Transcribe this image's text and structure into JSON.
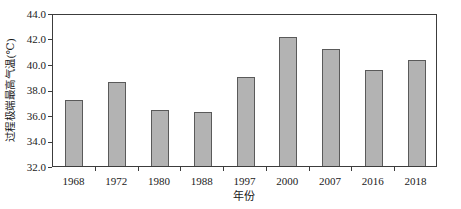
{
  "chart_data": {
    "type": "bar",
    "categories": [
      "1968",
      "1972",
      "1980",
      "1988",
      "1997",
      "2000",
      "2007",
      "2016",
      "2018"
    ],
    "values": [
      37.2,
      38.6,
      36.4,
      36.2,
      39.0,
      42.1,
      41.2,
      39.5,
      40.3
    ],
    "title": "",
    "xlabel": "年份",
    "ylabel": "过程极端最高气温(℃)",
    "ylim": [
      32.0,
      44.0
    ],
    "ytick_step": 2.0,
    "ytick_labels": [
      "32.0",
      "34.0",
      "36.0",
      "38.0",
      "40.0",
      "42.0",
      "44.0"
    ],
    "grid": false,
    "legend_position": "none",
    "colors": {
      "bar_fill": "#b3b3b3",
      "bar_border": "#5a5a5a",
      "axis": "#3c3c3c",
      "background": "#ffffff",
      "text": "#1a1a1a"
    }
  }
}
